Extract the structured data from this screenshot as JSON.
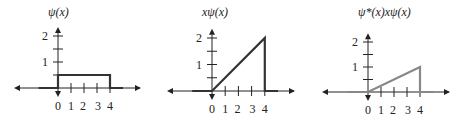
{
  "chart_data": [
    {
      "type": "line",
      "title": "ψ(x)",
      "xlabel": "",
      "ylabel": "ψ(x)",
      "xticks": [
        "0",
        "1",
        "2",
        "3",
        "4"
      ],
      "yticks": [
        "1",
        "2"
      ],
      "xlim": [
        -3.5,
        5.5
      ],
      "ylim": [
        0,
        2.4
      ],
      "grid": false,
      "x": [
        -1.5,
        0,
        0,
        4,
        4,
        5
      ],
      "y": [
        0,
        0,
        0.5,
        0.5,
        0,
        0
      ],
      "line_color": "#333333"
    },
    {
      "type": "line",
      "title": "xψ(x)",
      "xlabel": "",
      "ylabel": "xψ(x)",
      "xticks": [
        "0",
        "1",
        "2",
        "3",
        "4"
      ],
      "yticks": [
        "1",
        "2"
      ],
      "xlim": [
        -3.5,
        5.5
      ],
      "ylim": [
        0,
        2.4
      ],
      "grid": false,
      "x": [
        -1.5,
        0,
        4,
        4,
        5
      ],
      "y": [
        0,
        0,
        2,
        0,
        0
      ],
      "line_color": "#333333"
    },
    {
      "type": "line",
      "title": "ψ*(x)xψ(x)",
      "xlabel": "",
      "ylabel": "ψ*(x)xψ(x)",
      "xticks": [
        "0",
        "1",
        "2",
        "3",
        "4"
      ],
      "yticks": [
        "1",
        "2"
      ],
      "xlim": [
        -3.5,
        5.5
      ],
      "ylim": [
        0,
        2.4
      ],
      "grid": false,
      "x": [
        -1.5,
        0,
        4,
        4,
        5
      ],
      "y": [
        0,
        0,
        1,
        0,
        0
      ],
      "line_color": "#888888"
    }
  ],
  "panels": [
    {
      "title": "ψ(x)",
      "ox": 58,
      "oy": 88,
      "ux": 13,
      "uy": 26,
      "xl": 14,
      "xr": 146
    },
    {
      "title": "xψ(x)",
      "ox": 212,
      "oy": 91,
      "ux": 13.2,
      "uy": 26.5,
      "xl": 167,
      "xr": 300
    },
    {
      "title": "ψ*(x)xψ(x)",
      "ox": 368,
      "oy": 92,
      "ux": 13,
      "uy": 25,
      "xl": 322,
      "xr": 455
    }
  ]
}
